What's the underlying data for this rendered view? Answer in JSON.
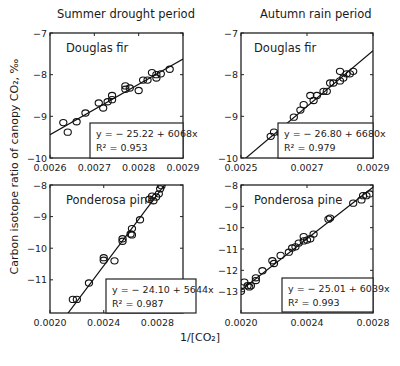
{
  "column_titles": [
    "Summer drought period",
    "Autumn rain period"
  ],
  "ylabel": "Carbon isotope ratio of canopy CO₂, ‰",
  "xlabel": "1/[CO₂]",
  "chart_data": [
    {
      "type": "scatter",
      "panel": "top-left",
      "period": "Summer drought period",
      "species": "Douglas fir",
      "xlim": [
        0.0026,
        0.0029
      ],
      "ylim": [
        -10,
        -7
      ],
      "xticks": [
        0.0026,
        0.0027,
        0.0028,
        0.0029
      ],
      "xtick_labels": [
        "0.0026",
        "0.0027",
        "0.0028",
        "0.0029"
      ],
      "yticks": [
        -10,
        -9,
        -8,
        -7
      ],
      "ytick_labels": [
        "−10",
        "−9",
        "−8",
        "−7"
      ],
      "fit": {
        "intercept": -25.22,
        "slope": 6068,
        "r2": 0.953
      },
      "equation_label": "y =  − 25.22 + 6068x",
      "r2_label": "R² = 0.953",
      "points": [
        [
          0.00263,
          -9.15
        ],
        [
          0.00264,
          -9.38
        ],
        [
          0.00266,
          -9.13
        ],
        [
          0.00268,
          -8.92
        ],
        [
          0.00271,
          -8.68
        ],
        [
          0.00272,
          -8.8
        ],
        [
          0.00273,
          -8.65
        ],
        [
          0.00274,
          -8.5
        ],
        [
          0.00274,
          -8.6
        ],
        [
          0.00277,
          -8.27
        ],
        [
          0.00277,
          -8.35
        ],
        [
          0.00278,
          -8.32
        ],
        [
          0.0028,
          -8.38
        ],
        [
          0.00281,
          -8.13
        ],
        [
          0.00282,
          -8.13
        ],
        [
          0.00283,
          -7.95
        ],
        [
          0.00284,
          -8.08
        ],
        [
          0.00284,
          -8.0
        ],
        [
          0.00285,
          -7.98
        ],
        [
          0.00287,
          -7.87
        ]
      ]
    },
    {
      "type": "scatter",
      "panel": "top-right",
      "period": "Autumn rain period",
      "species": "Douglas fir",
      "xlim": [
        0.0025,
        0.0029
      ],
      "ylim": [
        -10,
        -7
      ],
      "xticks": [
        0.0025,
        0.0027,
        0.0029
      ],
      "xtick_labels": [
        "0.0025",
        "0.0027",
        "0.0029"
      ],
      "yticks": [
        -10,
        -9,
        -8,
        -7
      ],
      "ytick_labels": [
        "−10",
        "−9",
        "−8",
        "−7"
      ],
      "fit": {
        "intercept": -26.8,
        "slope": 6680,
        "r2": 0.979
      },
      "equation_label": "y =  − 26.80 + 6680x",
      "r2_label": "R² = 0.979",
      "points": [
        [
          0.00259,
          -9.48
        ],
        [
          0.0026,
          -9.38
        ],
        [
          0.00262,
          -9.4
        ],
        [
          0.00263,
          -9.28
        ],
        [
          0.00264,
          -9.28
        ],
        [
          0.00266,
          -9.02
        ],
        [
          0.00268,
          -8.85
        ],
        [
          0.00269,
          -8.72
        ],
        [
          0.00271,
          -8.5
        ],
        [
          0.00272,
          -8.62
        ],
        [
          0.00273,
          -8.5
        ],
        [
          0.00275,
          -8.4
        ],
        [
          0.00276,
          -8.4
        ],
        [
          0.00277,
          -8.2
        ],
        [
          0.00278,
          -8.2
        ],
        [
          0.0028,
          -8.15
        ],
        [
          0.0028,
          -7.92
        ],
        [
          0.00281,
          -8.08
        ],
        [
          0.00282,
          -7.98
        ],
        [
          0.00283,
          -7.98
        ],
        [
          0.00284,
          -7.92
        ]
      ]
    },
    {
      "type": "scatter",
      "panel": "bottom-left",
      "period": "Summer drought period",
      "species": "Ponderosa pine",
      "xlim": [
        0.002,
        0.00299
      ],
      "ylim": [
        -12.05,
        -8
      ],
      "xticks": [
        0.002,
        0.0024,
        0.0028
      ],
      "xtick_labels": [
        "0.0020",
        "0.0024",
        "0.0028"
      ],
      "yticks": [
        -11,
        -10,
        -9,
        -8
      ],
      "ytick_labels": [
        "−11",
        "−10",
        "−9",
        "−8"
      ],
      "fit": {
        "intercept": -24.1,
        "slope": 5644,
        "r2": 0.987
      },
      "equation_label": "y =  − 24.10 + 5644x",
      "r2_label": "R² = 0.987",
      "points": [
        [
          0.00217,
          -11.62
        ],
        [
          0.0022,
          -11.62
        ],
        [
          0.00229,
          -11.1
        ],
        [
          0.0024,
          -10.3
        ],
        [
          0.0024,
          -10.38
        ],
        [
          0.00248,
          -10.4
        ],
        [
          0.00254,
          -9.7
        ],
        [
          0.00254,
          -9.78
        ],
        [
          0.0026,
          -9.55
        ],
        [
          0.00261,
          -9.38
        ],
        [
          0.00261,
          -9.58
        ],
        [
          0.00267,
          -9.1
        ],
        [
          0.00274,
          -8.45
        ],
        [
          0.00276,
          -8.35
        ],
        [
          0.00277,
          -8.5
        ],
        [
          0.00279,
          -8.38
        ],
        [
          0.00281,
          -8.28
        ],
        [
          0.00282,
          -8.12
        ],
        [
          0.00283,
          -8.02
        ]
      ]
    },
    {
      "type": "scatter",
      "panel": "bottom-right",
      "period": "Autumn rain period",
      "species": "Ponderosa pine",
      "xlim": [
        0.002,
        0.0028
      ],
      "ylim": [
        -14,
        -8
      ],
      "xticks": [
        0.002,
        0.0024,
        0.0028
      ],
      "xtick_labels": [
        "0.0020",
        "0.0024",
        "0.0028"
      ],
      "yticks": [
        -13,
        -12,
        -11,
        -10,
        -9,
        -8
      ],
      "ytick_labels": [
        "−13",
        "−12",
        "−11",
        "−10",
        "−9",
        "−8"
      ],
      "fit": {
        "intercept": -25.01,
        "slope": 6039,
        "r2": 0.993
      },
      "equation_label": "y =  − 25.01 + 6039x",
      "r2_label": "R² = 0.993",
      "points": [
        [
          0.002,
          -12.98
        ],
        [
          0.00202,
          -12.55
        ],
        [
          0.00204,
          -12.72
        ],
        [
          0.00205,
          -12.78
        ],
        [
          0.00206,
          -12.72
        ],
        [
          0.00209,
          -12.48
        ],
        [
          0.00209,
          -12.35
        ],
        [
          0.00213,
          -12.02
        ],
        [
          0.00219,
          -11.55
        ],
        [
          0.0022,
          -11.68
        ],
        [
          0.00224,
          -11.3
        ],
        [
          0.00229,
          -11.15
        ],
        [
          0.00231,
          -10.95
        ],
        [
          0.00233,
          -10.9
        ],
        [
          0.00235,
          -10.72
        ],
        [
          0.00238,
          -10.42
        ],
        [
          0.00238,
          -10.62
        ],
        [
          0.0024,
          -10.58
        ],
        [
          0.00242,
          -10.52
        ],
        [
          0.00244,
          -10.3
        ],
        [
          0.00253,
          -9.6
        ],
        [
          0.00254,
          -9.55
        ],
        [
          0.00268,
          -8.85
        ],
        [
          0.00273,
          -8.7
        ],
        [
          0.00274,
          -8.5
        ],
        [
          0.00276,
          -8.5
        ],
        [
          0.00278,
          -8.42
        ]
      ]
    }
  ]
}
